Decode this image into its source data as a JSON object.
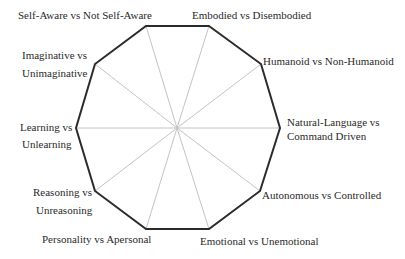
{
  "diagram": {
    "type": "decagon-radar",
    "center": [
      177,
      128
    ],
    "colors": {
      "outline": "#2b2b2b",
      "spokes": "#c4c4c4",
      "text": "#2a2a2a",
      "background": "#ffffff"
    },
    "axes": [
      {
        "id": "embodied",
        "lines": [
          "Embodied vs Disembodied"
        ],
        "vertex": [
          209,
          26
        ]
      },
      {
        "id": "humanoid",
        "lines": [
          "Humanoid vs Non-Humanoid"
        ],
        "vertex": [
          261,
          64
        ]
      },
      {
        "id": "natural-language",
        "lines": [
          "Natural-Language vs",
          "Command Driven"
        ],
        "vertex": [
          280,
          128
        ]
      },
      {
        "id": "autonomous",
        "lines": [
          "Autonomous vs Controlled"
        ],
        "vertex": [
          260,
          191
        ]
      },
      {
        "id": "emotional",
        "lines": [
          "Emotional vs Unemotional"
        ],
        "vertex": [
          209,
          229
        ]
      },
      {
        "id": "personality",
        "lines": [
          "Personality vs Apersonal"
        ],
        "vertex": [
          146,
          229
        ]
      },
      {
        "id": "reasoning",
        "lines": [
          "Reasoning vs",
          "Unreasoning"
        ],
        "vertex": [
          95,
          191
        ]
      },
      {
        "id": "learning",
        "lines": [
          "Learning vs",
          "Unlearning"
        ],
        "vertex": [
          76,
          128
        ]
      },
      {
        "id": "imaginative",
        "lines": [
          "Imaginative vs",
          "Unimaginative"
        ],
        "vertex": [
          95,
          64
        ]
      },
      {
        "id": "self-aware",
        "lines": [
          "Self-Aware vs Not Self-Aware"
        ],
        "vertex": [
          146,
          26
        ]
      }
    ]
  },
  "labels": {
    "embodied": "Embodied vs Disembodied",
    "humanoid": "Humanoid vs Non-Humanoid",
    "natural_1": "Natural-Language vs",
    "natural_2": "Command Driven",
    "autonomous": "Autonomous vs Controlled",
    "emotional": "Emotional vs Unemotional",
    "personality": "Personality vs Apersonal",
    "reasoning_1": "Reasoning vs",
    "reasoning_2": "Unreasoning",
    "learning_1": "Learning vs",
    "learning_2": "Unlearning",
    "imaginative_1": "Imaginative vs",
    "imaginative_2": "Unimaginative",
    "self_aware": "Self-Aware vs Not Self-Aware"
  }
}
